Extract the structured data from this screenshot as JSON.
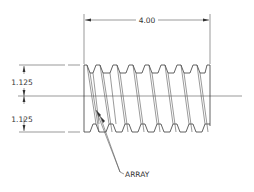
{
  "drawing": {
    "title": "Threaded screw drawing",
    "dimensions": {
      "length": "4.00",
      "upper_half_height": "1.125",
      "lower_half_height": "1.125"
    },
    "annotation": "ARRAY",
    "thread_count": 8,
    "colors": {
      "line": "#3a3a3a",
      "background": "#ffffff"
    }
  }
}
